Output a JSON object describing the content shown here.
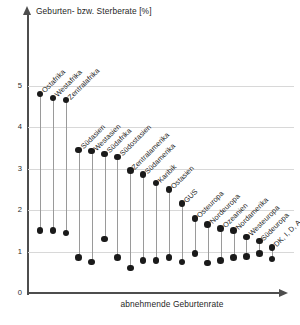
{
  "chart_data": {
    "type": "scatter",
    "subtype": "dumbbell-dot-plot",
    "title": "Geburten- bzw. Sterberate  [%]",
    "ylabel": "Geburten- bzw. Sterberate  [%]",
    "xlabel": "abnehmende Geburtenrate",
    "ylim": [
      0,
      5.4
    ],
    "yticks": [
      0,
      1,
      2,
      3,
      4,
      5
    ],
    "ytick_labels": [
      "0",
      "1",
      "2",
      "3",
      "4",
      "5"
    ],
    "grid": true,
    "legend": false,
    "legend_position": "none",
    "categories": [
      "Ostafrika",
      "Westafrika",
      "Zentralafrika",
      "Südasien",
      "Westasien",
      "Südafrika",
      "Südostasien",
      "Zentralamerika",
      "Südamerika",
      "Karibik",
      "Ostasien",
      "GUS",
      "Osteuropa",
      "Nordeuropa",
      "Ozeanien",
      "Nordamerika",
      "Westeuropa",
      "Südeuropa",
      "DK, I, D, A"
    ],
    "series": [
      {
        "name": "Geburtenrate",
        "values": [
          4.8,
          4.7,
          4.65,
          3.45,
          3.42,
          3.35,
          3.28,
          2.95,
          2.85,
          2.65,
          2.5,
          2.15,
          1.8,
          1.65,
          1.55,
          1.5,
          1.35,
          1.25,
          1.1
        ]
      },
      {
        "name": "Sterberate",
        "values": [
          1.5,
          1.5,
          1.45,
          0.85,
          0.75,
          1.3,
          0.85,
          0.6,
          0.78,
          0.78,
          0.85,
          0.75,
          0.95,
          0.72,
          0.78,
          0.85,
          0.88,
          0.95,
          0.82
        ]
      }
    ]
  },
  "axes": {
    "y_title": "Geburten- bzw. Sterberate  [%]",
    "x_title": "abnehmende Geburtenrate"
  },
  "colors": {
    "dot": "#1a1a1a",
    "stem": "#9a9a9a",
    "grid": "#d8d8d8",
    "axis": "#4d4d4d",
    "background": "#ffffff"
  }
}
